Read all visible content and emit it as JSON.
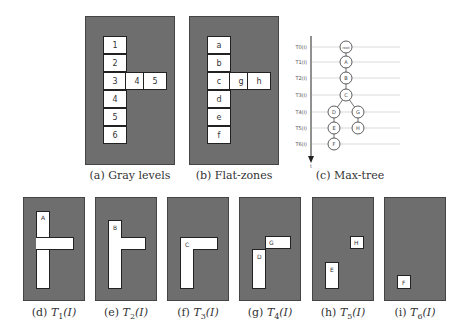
{
  "figure": {
    "panels": {
      "a": {
        "caption": "(a) Gray levels",
        "cells": [
          "1",
          "2",
          "3",
          "4",
          "5",
          "6"
        ],
        "branch": [
          "4",
          "5"
        ]
      },
      "b": {
        "caption": "(b) Flat-zones",
        "cells": [
          "a",
          "b",
          "c",
          "d",
          "e",
          "f"
        ],
        "branch": [
          "g",
          "h"
        ]
      },
      "c": {
        "caption": "(c) Max-tree",
        "levels": [
          "T0(I)",
          "T1(I)",
          "T2(I)",
          "T3(I)",
          "T4(I)",
          "T5(I)",
          "T6(I)"
        ],
        "axis_label": "t",
        "nodes": {
          "root": "root",
          "A": "A",
          "B": "B",
          "C": "C",
          "D": "D",
          "E": "E",
          "F": "F",
          "G": "G",
          "H": "H"
        }
      },
      "d": {
        "caption_prefix": "(d) ",
        "caption_t": "T",
        "caption_sub": "1",
        "caption_suffix": "(I)",
        "labels": [
          "A"
        ]
      },
      "e": {
        "caption_prefix": "(e) ",
        "caption_t": "T",
        "caption_sub": "2",
        "caption_suffix": "(I)",
        "labels": [
          "B"
        ]
      },
      "f": {
        "caption_prefix": "(f) ",
        "caption_t": "T",
        "caption_sub": "3",
        "caption_suffix": "(I)",
        "labels": [
          "C"
        ]
      },
      "g": {
        "caption_prefix": "(g) ",
        "caption_t": "T",
        "caption_sub": "4",
        "caption_suffix": "(I)",
        "labels": [
          "D",
          "G"
        ]
      },
      "h": {
        "caption_prefix": "(h) ",
        "caption_t": "T",
        "caption_sub": "5",
        "caption_suffix": "(I)",
        "labels": [
          "E",
          "H"
        ]
      },
      "i": {
        "caption_prefix": "(i) ",
        "caption_t": "T",
        "caption_sub": "6",
        "caption_suffix": "(I)",
        "labels": [
          "F"
        ]
      }
    }
  }
}
